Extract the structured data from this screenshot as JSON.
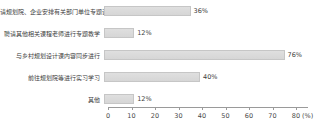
{
  "chart_data": {
    "type": "bar",
    "orientation": "horizontal",
    "title": "",
    "categories": [
      "请规划院、企业安排有关部门单位专题讲解",
      "聘请其他相关课程老师进行专题教学",
      "与乡村规划设计课内容同步进行",
      "前往规划院等进行实习学习",
      "其他"
    ],
    "values": [
      36,
      12,
      76,
      40,
      12
    ],
    "value_labels": [
      "36%",
      "12%",
      "76%",
      "40%",
      "12%"
    ],
    "xlabel": "(%)",
    "xlim": [
      0,
      80
    ],
    "xticks": [
      "0",
      "10",
      "20",
      "30",
      "40",
      "50",
      "60",
      "70",
      "80"
    ],
    "grid": "off",
    "legend": "none",
    "colors": {
      "bar_fill": "#d6d6d6",
      "bar_border": "#c6c6c6",
      "label_text": "#3d3d3d",
      "axis_line": "#9a9a9a",
      "background": "#ffffff"
    }
  }
}
